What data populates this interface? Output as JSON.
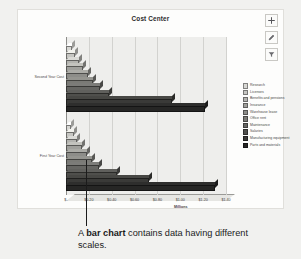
{
  "figure": {
    "caption_prefix": "A ",
    "caption_bold": "bar chart",
    "caption_suffix": " contains data having different scales."
  },
  "toolbar": {
    "items": [
      {
        "name": "add-icon",
        "label": "Add"
      },
      {
        "name": "edit-pencil-icon",
        "label": "Edit"
      },
      {
        "name": "filter-funnel-icon",
        "label": "Filter"
      }
    ]
  },
  "chart_data": {
    "type": "bar",
    "orientation": "horizontal",
    "title": "Cost Center",
    "xlabel": "Millions",
    "ylabel": "",
    "grid": true,
    "legend_position": "right",
    "xlim": [
      0,
      1.4
    ],
    "xticks": [
      0,
      0.2,
      0.4,
      0.6,
      0.8,
      1.0,
      1.2,
      1.4
    ],
    "xtick_labels": [
      "$-",
      "$0.20",
      "$0.40",
      "$0.60",
      "$0.80",
      "$1.00",
      "$1.20",
      "$1.40"
    ],
    "categories": [
      "Second Year Cost",
      "First Year Cost"
    ],
    "series": [
      {
        "name": "Research",
        "color": "#d8d8d4",
        "values": [
          0.05,
          0.04
        ]
      },
      {
        "name": "Licenses",
        "color": "#c6c6c2",
        "values": [
          0.08,
          0.07
        ]
      },
      {
        "name": "Benefits and pensions",
        "color": "#b3b3af",
        "values": [
          0.11,
          0.1
        ]
      },
      {
        "name": "Insurance",
        "color": "#a0a09c",
        "values": [
          0.15,
          0.14
        ]
      },
      {
        "name": "Warehouse lease",
        "color": "#8d8d89",
        "values": [
          0.19,
          0.18
        ]
      },
      {
        "name": "Office rent",
        "color": "#7a7a76",
        "values": [
          0.24,
          0.23
        ]
      },
      {
        "name": "Maintenance",
        "color": "#666663",
        "values": [
          0.3,
          0.29
        ]
      },
      {
        "name": "Salaries",
        "color": "#4f4f4c",
        "values": [
          0.38,
          0.45
        ]
      },
      {
        "name": "Manufacturing equipment",
        "color": "#3a3a38",
        "values": [
          0.93,
          0.73
        ]
      },
      {
        "name": "Parts and materials",
        "color": "#262625",
        "values": [
          1.22,
          1.3
        ]
      }
    ]
  }
}
